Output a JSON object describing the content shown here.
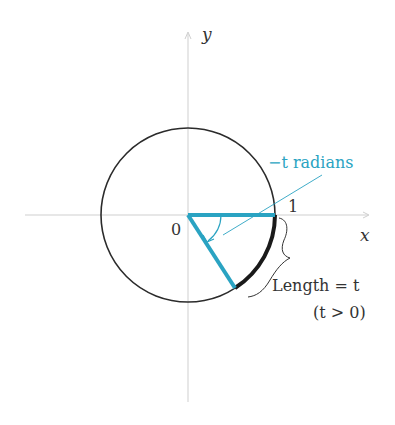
{
  "diagram": {
    "axes": {
      "x_label": "x",
      "y_label": "y"
    },
    "origin_label": "0",
    "unit_label": "1",
    "angle_label": "−t radians",
    "arc_length_label": "Length = t",
    "condition_label": "(t > 0)",
    "colors": {
      "accent": "#2aa3c2",
      "circle": "#2b2b2b",
      "axis": "#c8c8c8",
      "text": "#333333"
    }
  }
}
